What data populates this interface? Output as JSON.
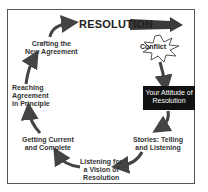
{
  "diagram": {
    "title": "RESOLUTION",
    "start": "Conflict",
    "highlight": "Your Attitude of Resolution",
    "steps": [
      {
        "line1": "Stories: Telling",
        "line2": "and Listening"
      },
      {
        "line1": "Listening for",
        "line2": "a Vision of",
        "line3": "Resolution"
      },
      {
        "line1": "Getting Current",
        "line2": "and Complete"
      },
      {
        "line1": "Reaching",
        "line2": "Agreement",
        "line3": "in Principle"
      },
      {
        "line1": "Crafting the",
        "line2": "New Agreement"
      }
    ],
    "colors": {
      "arrow": "#444444",
      "box": "#111111",
      "frame": "#555555"
    }
  }
}
